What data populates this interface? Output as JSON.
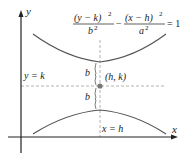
{
  "diagram": {
    "title_equation": {
      "term1_numerator": "(y − k)",
      "term1_numerator_exp": "2",
      "term1_denominator": "b",
      "term1_denominator_exp": "2",
      "minus": "−",
      "term2_numerator": "(x − h)",
      "term2_numerator_exp": "2",
      "term2_denominator": "a",
      "term2_denominator_exp": "2",
      "equals": "= 1"
    },
    "axes": {
      "x_label": "x",
      "y_label": "y"
    },
    "labels": {
      "horizontal_line": "y = k",
      "vertical_line": "x = h",
      "center": "(h, k)",
      "upper_distance": "b",
      "lower_distance": "b"
    },
    "colors": {
      "curve": "#555555",
      "axis": "#222222",
      "dashed": "#9a9a9a",
      "center_point": "#777777"
    }
  }
}
